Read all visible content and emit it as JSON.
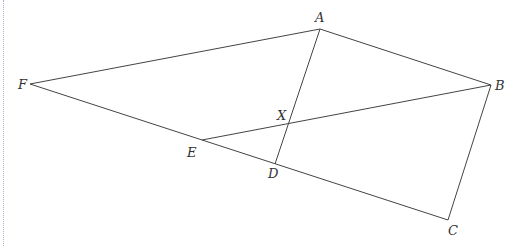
{
  "diagram": {
    "type": "geometry",
    "points": {
      "A": {
        "x": 320,
        "y": 29,
        "label": "A",
        "lx": 315,
        "ly": 22
      },
      "B": {
        "x": 491,
        "y": 85,
        "label": "B",
        "lx": 495,
        "ly": 90
      },
      "C": {
        "x": 448,
        "y": 220,
        "label": "C",
        "lx": 448,
        "ly": 235
      },
      "D": {
        "x": 275,
        "y": 164,
        "label": "D",
        "lx": 268,
        "ly": 178
      },
      "E": {
        "x": 202,
        "y": 140,
        "label": "E",
        "lx": 187,
        "ly": 157
      },
      "F": {
        "x": 30,
        "y": 84,
        "label": "F",
        "lx": 18,
        "ly": 89
      },
      "X": {
        "x": 289,
        "y": 123,
        "label": "X",
        "lx": 277,
        "ly": 120
      }
    },
    "segments": [
      [
        "F",
        "A"
      ],
      [
        "A",
        "B"
      ],
      [
        "B",
        "C"
      ],
      [
        "C",
        "F"
      ],
      [
        "A",
        "D"
      ],
      [
        "E",
        "B"
      ]
    ]
  }
}
